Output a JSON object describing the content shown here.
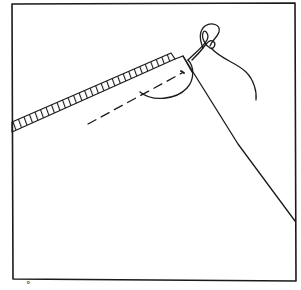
{
  "illustration": {
    "subject": "hand-sewing stitch: needle and thread through folded fabric hem",
    "colors": {
      "ink": "#1a1a1a",
      "background": "#ffffff"
    },
    "frame": {
      "x": 12,
      "y": 4,
      "width": 283,
      "height": 276
    },
    "elements": [
      "frame-border",
      "hatched-hem-edge",
      "fabric-fold-edge",
      "dashed-stitch-line",
      "thread-loop",
      "needle-line",
      "thread-tail"
    ]
  },
  "caption": {
    "glyph": "°"
  }
}
